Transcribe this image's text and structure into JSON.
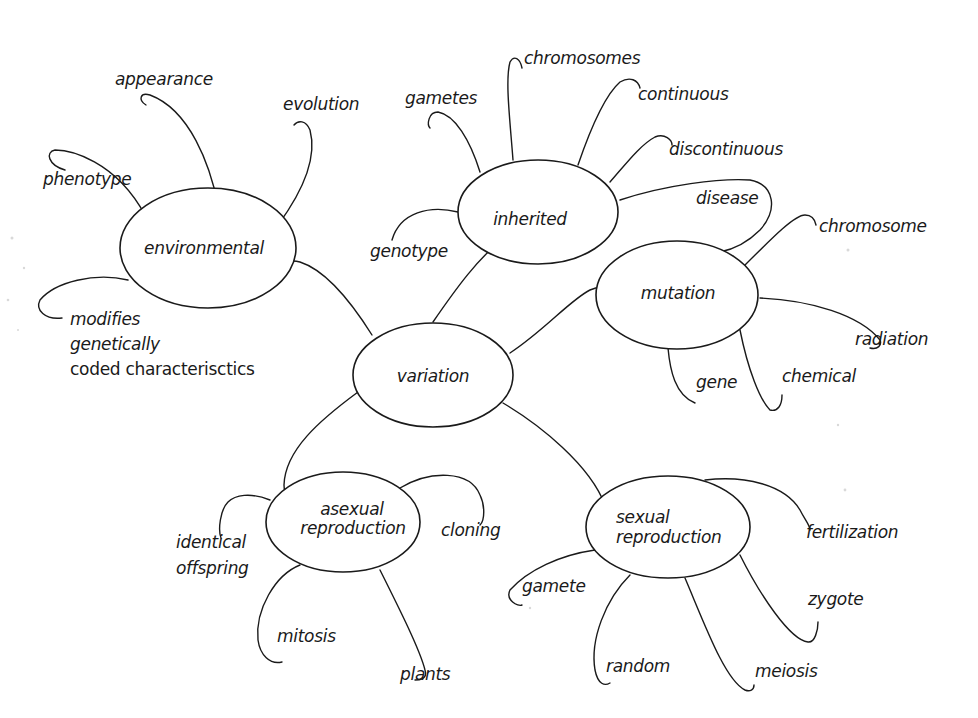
{
  "diagram": {
    "type": "mind-map",
    "colors": {
      "ink": "#1a1a1a",
      "paper": "#ffffff"
    },
    "center": {
      "id": "variation",
      "label": "variation"
    },
    "branches": [
      {
        "id": "environmental",
        "label": "environmental",
        "leaves": [
          "appearance",
          "evolution",
          "phenotype",
          "modifies",
          "genetically",
          "coded characterisctics"
        ]
      },
      {
        "id": "inherited",
        "label": "inherited",
        "leaves": [
          "gametes",
          "chromosomes",
          "continuous",
          "discontinuous",
          "disease",
          "genotype"
        ]
      },
      {
        "id": "mutation",
        "label": "mutation",
        "leaves": [
          "chromosome",
          "radiation",
          "chemical",
          "gene"
        ]
      },
      {
        "id": "asexual",
        "label_lines": [
          "asexual",
          "reproduction"
        ],
        "leaves": [
          "identical",
          "offspring",
          "cloning",
          "mitosis",
          "plants"
        ]
      },
      {
        "id": "sexual",
        "label_lines": [
          "sexual",
          "reproduction"
        ],
        "leaves": [
          "fertilization",
          "gamete",
          "zygote",
          "random",
          "meiosis"
        ]
      }
    ]
  }
}
